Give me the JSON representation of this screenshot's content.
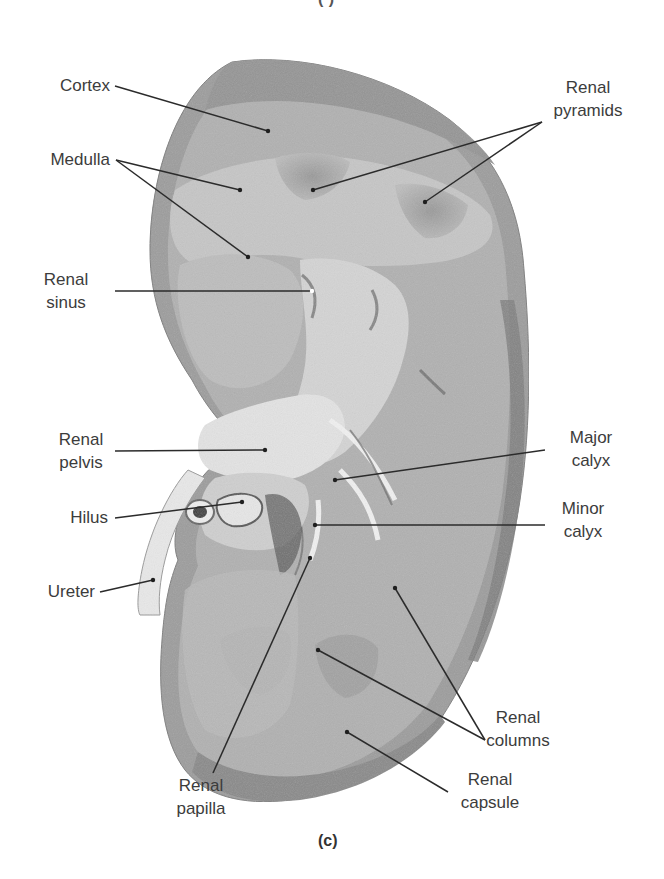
{
  "figure": {
    "caption": "(c)",
    "top_partial_caption": "(·)",
    "colors": {
      "background": "#ffffff",
      "capsule": "#8f8f8f",
      "cortex": "#a9a9a9",
      "medulla": "#c3c3c3",
      "pyramid_shade": "#8a8a8a",
      "sinus_fat": "#d9d9d9",
      "pelvis_wall": "#e6e6e6",
      "leader_line": "#2b2b2b",
      "label_text": "#3c3c3c"
    }
  },
  "labels": {
    "cortex": "Cortex",
    "medulla": "Medulla",
    "renal_pyramids_1": "Renal",
    "renal_pyramids_2": "pyramids",
    "renal_sinus_1": "Renal",
    "renal_sinus_2": "sinus",
    "renal_pelvis_1": "Renal",
    "renal_pelvis_2": "pelvis",
    "hilus": "Hilus",
    "ureter": "Ureter",
    "major_calyx_1": "Major",
    "major_calyx_2": "calyx",
    "minor_calyx_1": "Minor",
    "minor_calyx_2": "calyx",
    "renal_columns_1": "Renal",
    "renal_columns_2": "columns",
    "renal_capsule_1": "Renal",
    "renal_capsule_2": "capsule",
    "renal_papilla_1": "Renal",
    "renal_papilla_2": "papilla"
  }
}
